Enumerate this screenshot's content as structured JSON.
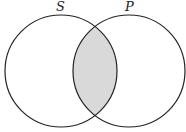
{
  "diagram": {
    "type": "venn",
    "sets": [
      {
        "label": "S",
        "cx": 61,
        "cy": 71,
        "r": 56
      },
      {
        "label": "P",
        "cx": 129,
        "cy": 71,
        "r": 56
      }
    ],
    "shaded_region": "S ∩ P",
    "shade_color": "#d9d9d9",
    "stroke_color": "#222222"
  }
}
